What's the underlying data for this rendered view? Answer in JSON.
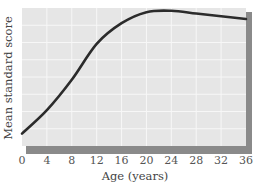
{
  "chart_data": {
    "type": "line",
    "title": "",
    "xlabel": "Age (years)",
    "ylabel": "Mean standard score",
    "x": [
      0,
      4,
      8,
      12,
      16,
      20,
      24,
      28,
      32,
      36
    ],
    "series": [
      {
        "name": "Mean standard score",
        "values": [
          9,
          26,
          48,
          74,
          89,
          97,
          98,
          96,
          94,
          92
        ]
      }
    ],
    "x_ticks": [
      "0",
      "4",
      "8",
      "12",
      "16",
      "20",
      "24",
      "28",
      "32",
      "36"
    ],
    "xlim": [
      0,
      36
    ],
    "ylim": [
      0,
      100
    ],
    "y_ticks_shown": false,
    "grid": true,
    "legend": null,
    "note": "Y values are relative (percent of plot height); the y-axis has no numeric tick labels."
  },
  "colors": {
    "plot_background": "#e6e6e6",
    "grid": "#f7f7f7",
    "line": "#2b2b2b",
    "frame_shadow": "#8a8a8a"
  }
}
